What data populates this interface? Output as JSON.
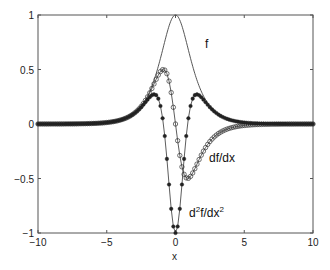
{
  "chart_data": {
    "type": "line",
    "title": "",
    "xlabel": "x",
    "ylabel": "",
    "xlim": [
      -10,
      10
    ],
    "ylim": [
      -1,
      1
    ],
    "grid": false,
    "legend": "none (inline annotations)",
    "x_ticks": [
      "-10",
      "-5",
      "0",
      "5",
      "10"
    ],
    "y_ticks": [
      "1",
      "0.5",
      "0",
      "-0.5",
      "-1"
    ],
    "series": [
      {
        "name": "f",
        "style": "solid line, no markers",
        "function": "sech(x)",
        "key_points": [
          {
            "x": 0,
            "y": 1
          },
          {
            "x": -2,
            "y": 0.27
          },
          {
            "x": 2,
            "y": 0.27
          },
          {
            "x": -5,
            "y": 0.01
          },
          {
            "x": 5,
            "y": 0.01
          }
        ]
      },
      {
        "name": "df/dx",
        "style": "line with open circle markers",
        "function": "-sech(x)tanh(x)",
        "key_points": [
          {
            "x": -0.88,
            "y": 0.5
          },
          {
            "x": 0,
            "y": 0
          },
          {
            "x": 0.88,
            "y": -0.5
          }
        ]
      },
      {
        "name": "d^2f/dx^2",
        "style": "line with filled dot markers",
        "function": "sech(x)(1-2sech^2(x))",
        "key_points": [
          {
            "x": -1.53,
            "y": 0.27
          },
          {
            "x": 0,
            "y": -1
          },
          {
            "x": 1.53,
            "y": 0.27
          }
        ]
      }
    ],
    "annotations": [
      {
        "text": "f",
        "x": 1.5,
        "y": 0.75
      },
      {
        "text": "df/dx",
        "x": 1.6,
        "y": -0.32
      },
      {
        "text": "d2f/dx2",
        "x": 0.7,
        "y": -0.8
      }
    ]
  },
  "labels": {
    "f": "f",
    "dfdx": "df/dx",
    "d2_d": "d",
    "d2_sup1": "2",
    "d2_mid": "f/dx",
    "d2_sup2": "2",
    "xlabel": "x"
  },
  "ticks": {
    "x": [
      "-10",
      "-5",
      "0",
      "5",
      "10"
    ],
    "y": [
      "1",
      "0.5",
      "0",
      "-0.5",
      "-1"
    ]
  }
}
